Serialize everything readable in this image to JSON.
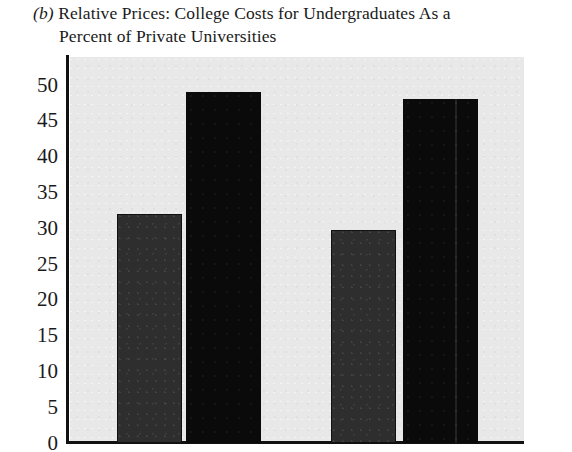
{
  "caption": {
    "label": "(b)",
    "line1": "Relative Prices: College Costs for Undergraduates As a",
    "line2": "Percent of Private Universities"
  },
  "chart_data": {
    "type": "bar",
    "title": "Relative Prices: College Costs for Undergraduates As a Percent of Private Universities",
    "xlabel": "",
    "ylabel": "",
    "ylim": [
      0,
      52
    ],
    "yticks": [
      0,
      5,
      10,
      15,
      20,
      25,
      30,
      35,
      40,
      45,
      50
    ],
    "ytick_labels": [
      "0",
      "5",
      "10",
      "15",
      "20",
      "25",
      "30",
      "35",
      "40",
      "45",
      "50"
    ],
    "grid": false,
    "legend": "none",
    "categories": [
      "",
      ""
    ],
    "series": [
      {
        "name": "dark-gray",
        "color": "#2e2e2e",
        "values": [
          32.0,
          29.8
        ]
      },
      {
        "name": "black",
        "color": "#0a0a0a",
        "values": [
          49.0,
          48.0
        ]
      }
    ],
    "bars": [
      {
        "name": "group1-bar1",
        "value": 32.0,
        "style": "dark-gray",
        "left": 117,
        "width": 65
      },
      {
        "name": "group1-bar2",
        "value": 49.0,
        "style": "black",
        "left": 186,
        "width": 75
      },
      {
        "name": "group2-bar1",
        "value": 29.8,
        "style": "dark-gray",
        "left": 331,
        "width": 65
      },
      {
        "name": "group2-bar2",
        "value": 48.0,
        "style": "black",
        "left": 403,
        "width": 75
      }
    ],
    "plot_background": "#e8e8e8",
    "axis_color": "#111111"
  }
}
